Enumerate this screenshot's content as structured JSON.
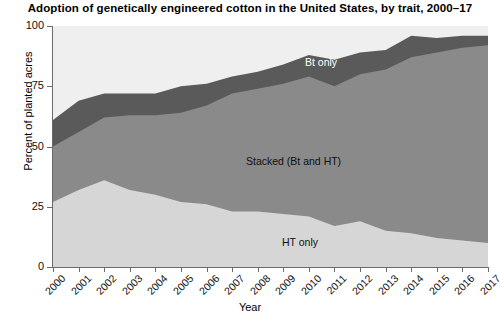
{
  "chart_data": {
    "type": "area",
    "title": "Adoption of genetically engineered cotton in the United States, by trait, 2000–17",
    "xlabel": "Year",
    "ylabel": "Percent of planted acres",
    "ylim": [
      0,
      100
    ],
    "yticks": [
      0,
      25,
      50,
      75,
      100
    ],
    "grid": false,
    "legend_position": "inline-annotations",
    "stacked": true,
    "categories": [
      2000,
      2001,
      2002,
      2003,
      2004,
      2005,
      2006,
      2007,
      2008,
      2009,
      2010,
      2011,
      2012,
      2013,
      2014,
      2015,
      2016,
      2017
    ],
    "series": [
      {
        "name": "HT only",
        "color": "#d6d6d6",
        "values": [
          27,
          32,
          36,
          32,
          30,
          27,
          26,
          23,
          23,
          22,
          21,
          17,
          19,
          15,
          14,
          12,
          11,
          10
        ]
      },
      {
        "name": "Stacked (Bt and HT)",
        "color": "#8a8a8a",
        "values": [
          23,
          24,
          26,
          31,
          33,
          37,
          41,
          49,
          51,
          54,
          58,
          58,
          61,
          67,
          73,
          77,
          80,
          82
        ]
      },
      {
        "name": "Bt only",
        "color": "#5a5a5a",
        "values": [
          11,
          13,
          10,
          9,
          9,
          11,
          9,
          7,
          7,
          8,
          9,
          11,
          9,
          8,
          9,
          6,
          5,
          4
        ]
      }
    ],
    "cumulative_tops": {
      "ht_only": [
        27,
        32,
        36,
        32,
        30,
        27,
        26,
        23,
        23,
        22,
        21,
        17,
        19,
        15,
        14,
        12,
        11,
        10
      ],
      "ht_plus_stacked": [
        50,
        56,
        62,
        63,
        63,
        64,
        67,
        72,
        74,
        76,
        79,
        75,
        80,
        82,
        87,
        89,
        91,
        92
      ],
      "total": [
        61,
        69,
        72,
        72,
        72,
        75,
        76,
        79,
        81,
        84,
        88,
        86,
        89,
        90,
        96,
        95,
        96,
        96
      ]
    },
    "annotations": [
      {
        "text": "Bt only",
        "series": "Bt only"
      },
      {
        "text": "Stacked (Bt and HT)",
        "series": "Stacked (Bt and HT)"
      },
      {
        "text": "HT only",
        "series": "HT only"
      }
    ]
  },
  "axes": {
    "y_tick_labels": [
      "100",
      "75",
      "50",
      "25",
      "0"
    ],
    "x_tick_labels": [
      "2000",
      "2001",
      "2002",
      "2003",
      "2004",
      "2005",
      "2006",
      "2007",
      "2008",
      "2009",
      "2010",
      "2011",
      "2012",
      "2013",
      "2014",
      "2015",
      "2016",
      "2017"
    ]
  }
}
